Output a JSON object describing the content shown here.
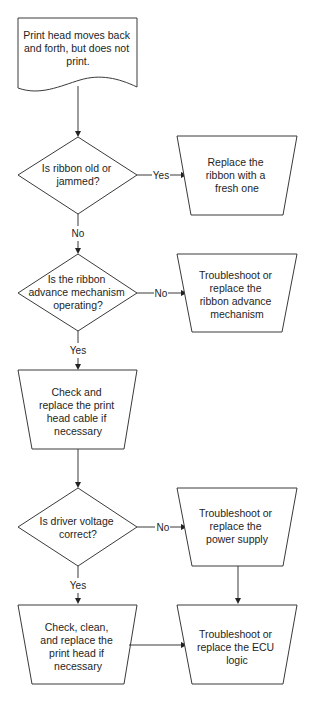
{
  "diagram": {
    "type": "flowchart",
    "nodes": {
      "start": {
        "shape": "document",
        "lines": [
          "Print head moves back",
          "and forth, but does not",
          "print."
        ]
      },
      "q1": {
        "shape": "decision",
        "lines": [
          "Is ribbon old or",
          "jammed?"
        ]
      },
      "a1": {
        "shape": "manual-operation",
        "lines": [
          "Replace the",
          "ribbon with a",
          "fresh one"
        ]
      },
      "q2": {
        "shape": "decision",
        "lines": [
          "Is the ribbon",
          "advance mechanism",
          "operating?"
        ]
      },
      "a2": {
        "shape": "manual-operation",
        "lines": [
          "Troubleshoot or",
          "replace the",
          "ribbon advance",
          "mechanism"
        ]
      },
      "a3": {
        "shape": "manual-operation",
        "lines": [
          "Check and",
          "replace the print",
          "head cable if",
          "necessary"
        ]
      },
      "q3": {
        "shape": "decision",
        "lines": [
          "Is driver voltage",
          "correct?"
        ]
      },
      "a4": {
        "shape": "manual-operation",
        "lines": [
          "Troubleshoot or",
          "replace the",
          "power supply"
        ]
      },
      "a5": {
        "shape": "manual-operation",
        "lines": [
          "Check, clean,",
          "and replace the",
          "print head if",
          "necessary"
        ]
      },
      "a6": {
        "shape": "manual-operation",
        "lines": [
          "Troubleshoot or",
          "replace the ECU",
          "logic"
        ]
      }
    },
    "edges": [
      {
        "from": "start",
        "to": "q1",
        "label": ""
      },
      {
        "from": "q1",
        "to": "a1",
        "label": "Yes"
      },
      {
        "from": "q1",
        "to": "q2",
        "label": "No"
      },
      {
        "from": "q2",
        "to": "a2",
        "label": "No"
      },
      {
        "from": "q2",
        "to": "a3",
        "label": "Yes"
      },
      {
        "from": "a3",
        "to": "q3",
        "label": ""
      },
      {
        "from": "q3",
        "to": "a4",
        "label": "No"
      },
      {
        "from": "q3",
        "to": "a5",
        "label": "Yes"
      },
      {
        "from": "a4",
        "to": "a6",
        "label": ""
      },
      {
        "from": "a5",
        "to": "a6",
        "label": ""
      }
    ]
  }
}
